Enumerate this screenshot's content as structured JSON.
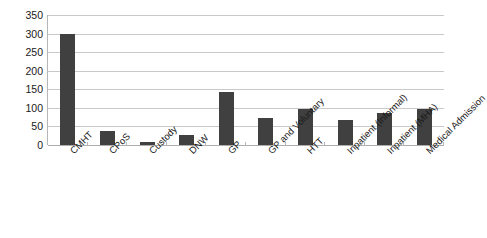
{
  "chart_data": {
    "type": "bar",
    "title": "",
    "subtitle": "",
    "xlabel": "",
    "ylabel": "",
    "categories": [
      "CMHT",
      "CPoS",
      "Custody",
      "DNW",
      "GP",
      "GP and Voluntary",
      "HTT",
      "Inpatient (Informal)",
      "Inpatient (MHA)",
      "Medical Admission"
    ],
    "values": [
      299,
      37,
      9,
      28,
      142,
      72,
      96,
      68,
      86,
      97
    ],
    "ylim": [
      0,
      350
    ],
    "ytick_values": [
      0,
      50,
      100,
      150,
      200,
      250,
      300,
      350
    ],
    "ytick_labels": [
      "0",
      "50",
      "100",
      "150",
      "200",
      "250",
      "300",
      "350"
    ],
    "grid": true,
    "legend": false,
    "legend_position": "none",
    "series": [
      {
        "name": "Referral source",
        "values": [
          299,
          37,
          9,
          28,
          142,
          72,
          96,
          68,
          86,
          97
        ]
      }
    ]
  },
  "style": {
    "bar_color": "#404040",
    "gridline_color": "#c9c9c9",
    "axis_color": "#b6b6b6",
    "text_color": "#1a1a1a",
    "background": "#ffffff"
  }
}
